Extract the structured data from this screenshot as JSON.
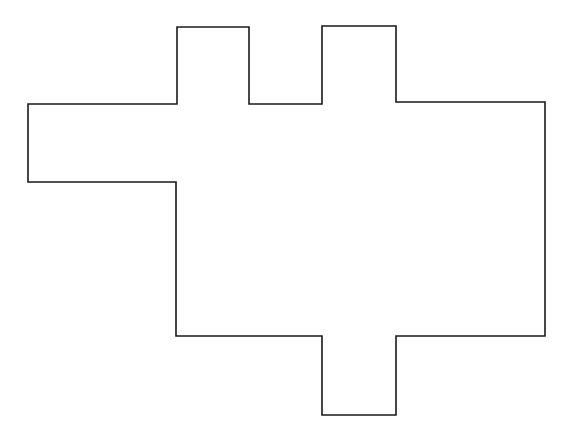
{
  "figure": {
    "shape_kind": "rectilinear-polygon",
    "closed": true,
    "vertex_count": 18,
    "canvas": {
      "width": 574,
      "height": 442,
      "background_color": "#ffffff"
    },
    "style": {
      "stroke_color": "#1a1a1a",
      "fill_color": "#ffffff",
      "stroke_width": 1.6,
      "line_join": "miter"
    },
    "bounding_box": {
      "x_min": 28,
      "y_min": 26,
      "x_max": 545,
      "y_max": 415,
      "width": 517,
      "height": 389
    },
    "vertices": [
      {
        "index": 0,
        "x": 177,
        "y": 27,
        "name": "top-tab-1-top-left"
      },
      {
        "index": 1,
        "x": 249,
        "y": 27,
        "name": "top-tab-1-top-right"
      },
      {
        "index": 2,
        "x": 249,
        "y": 104,
        "name": "top-tab-1-base-right"
      },
      {
        "index": 3,
        "x": 322,
        "y": 104,
        "name": "top-tab-2-base-left"
      },
      {
        "index": 4,
        "x": 322,
        "y": 26,
        "name": "top-tab-2-top-left"
      },
      {
        "index": 5,
        "x": 396,
        "y": 26,
        "name": "top-tab-2-top-right"
      },
      {
        "index": 6,
        "x": 396,
        "y": 102,
        "name": "top-tab-2-base-right"
      },
      {
        "index": 7,
        "x": 545,
        "y": 102,
        "name": "top-right-corner"
      },
      {
        "index": 8,
        "x": 545,
        "y": 336,
        "name": "bottom-right-corner"
      },
      {
        "index": 9,
        "x": 396,
        "y": 336,
        "name": "bottom-tab-right-shoulder"
      },
      {
        "index": 10,
        "x": 396,
        "y": 415,
        "name": "bottom-tab-bottom-right"
      },
      {
        "index": 11,
        "x": 322,
        "y": 415,
        "name": "bottom-tab-bottom-left"
      },
      {
        "index": 12,
        "x": 322,
        "y": 336,
        "name": "bottom-tab-left-shoulder"
      },
      {
        "index": 13,
        "x": 176,
        "y": 336,
        "name": "body-bottom-left-corner"
      },
      {
        "index": 14,
        "x": 176,
        "y": 182,
        "name": "left-tab-bottom-inner"
      },
      {
        "index": 15,
        "x": 28,
        "y": 182,
        "name": "left-tab-bottom-left"
      },
      {
        "index": 16,
        "x": 28,
        "y": 104,
        "name": "left-tab-top-left"
      },
      {
        "index": 17,
        "x": 177,
        "y": 104,
        "name": "left-tab-top-inner"
      }
    ],
    "path_d": "M 177 27 L 249 27 L 249 104 L 322 104 L 322 26 L 396 26 L 396 102 L 545 102 L 545 336 L 396 336 L 396 415 L 322 415 L 322 336 L 176 336 L 176 182 L 28 182 L 28 104 L 177 104 Z",
    "features": [
      {
        "name": "top-tab-left",
        "orientation": "up",
        "x_start": 177,
        "x_end": 249,
        "top": 27,
        "base": 104,
        "width": 72,
        "height": 77
      },
      {
        "name": "top-tab-right",
        "orientation": "up",
        "x_start": 322,
        "x_end": 396,
        "top": 26,
        "base": 103,
        "width": 74,
        "height": 77
      },
      {
        "name": "bottom-tab",
        "orientation": "down",
        "x_start": 322,
        "x_end": 396,
        "top": 336,
        "base": 415,
        "width": 74,
        "height": 79
      },
      {
        "name": "left-tab",
        "orientation": "left",
        "y_start": 104,
        "y_end": 182,
        "left": 28,
        "base": 177,
        "width": 149,
        "height": 78
      }
    ],
    "main_body": {
      "x_min": 176,
      "y_min": 102,
      "x_max": 545,
      "y_max": 336,
      "width": 369,
      "height": 234
    }
  }
}
